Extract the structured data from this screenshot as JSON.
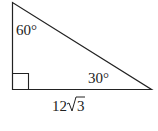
{
  "diagram": {
    "type": "right-triangle",
    "angles": {
      "top": "60°",
      "right": "30°"
    },
    "base_label": {
      "coefficient": "12",
      "radicand": "3"
    },
    "colors": {
      "stroke": "#222222",
      "background": "#ffffff"
    }
  }
}
